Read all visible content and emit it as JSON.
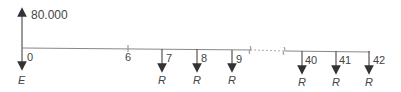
{
  "diagram": {
    "type": "cash-flow-timeline",
    "inflow": {
      "period": "0",
      "amount_label": "80.000"
    },
    "origin": {
      "label": "0",
      "outflow_label": "E"
    },
    "ticks": [
      {
        "label": "6"
      },
      {
        "label": "7",
        "payment": "R"
      },
      {
        "label": "8",
        "payment": "R"
      },
      {
        "label": "9",
        "payment": "R"
      },
      {
        "label": "40",
        "payment": "R"
      },
      {
        "label": "41",
        "payment": "R"
      },
      {
        "label": "42",
        "payment": "R"
      }
    ]
  }
}
